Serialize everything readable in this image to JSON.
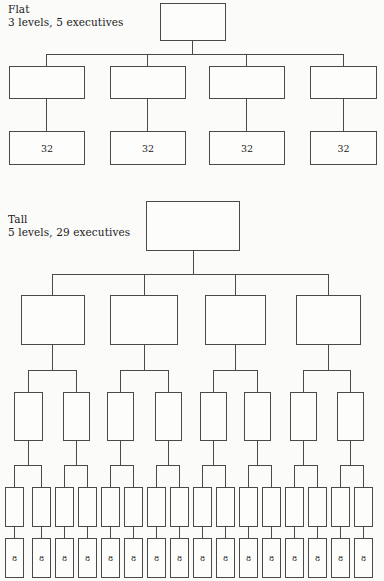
{
  "page": {
    "background_color": "#fbfbf9",
    "line_color": "#4a4a4a",
    "text_color": "#1a1a1a"
  },
  "charts": [
    {
      "id": "flat",
      "caption_title": "Flat",
      "caption_detail": "3 levels, 5 executives",
      "levels": 3,
      "executives": 5,
      "span_of_control": 4,
      "leaf_label": "32",
      "nodes": [
        {
          "name": "flat-level1-node1",
          "label": "",
          "x": 160,
          "y": 3,
          "w": 66,
          "h": 38,
          "level": 1
        },
        {
          "name": "flat-level2-node1",
          "label": "",
          "x": 9,
          "y": 66,
          "w": 76,
          "h": 33,
          "level": 2
        },
        {
          "name": "flat-level2-node2",
          "label": "",
          "x": 110,
          "y": 66,
          "w": 76,
          "h": 33,
          "level": 2
        },
        {
          "name": "flat-level2-node3",
          "label": "",
          "x": 209,
          "y": 66,
          "w": 76,
          "h": 33,
          "level": 2
        },
        {
          "name": "flat-level2-node4",
          "label": "",
          "x": 310,
          "y": 66,
          "w": 67,
          "h": 33,
          "level": 2
        },
        {
          "name": "flat-level3-node1",
          "label": "32",
          "x": 9,
          "y": 131,
          "w": 76,
          "h": 34,
          "level": 3
        },
        {
          "name": "flat-level3-node2",
          "label": "32",
          "x": 110,
          "y": 131,
          "w": 76,
          "h": 34,
          "level": 3
        },
        {
          "name": "flat-level3-node3",
          "label": "32",
          "x": 209,
          "y": 131,
          "w": 76,
          "h": 34,
          "level": 3
        },
        {
          "name": "flat-level3-node4",
          "label": "32",
          "x": 310,
          "y": 131,
          "w": 67,
          "h": 34,
          "level": 3
        }
      ],
      "vlines": [
        {
          "x": 192,
          "y": 41,
          "h": 13
        },
        {
          "x": 46,
          "y": 54,
          "h": 12
        },
        {
          "x": 147,
          "y": 54,
          "h": 12
        },
        {
          "x": 246,
          "y": 54,
          "h": 12
        },
        {
          "x": 343,
          "y": 54,
          "h": 12
        },
        {
          "x": 46,
          "y": 99,
          "h": 32
        },
        {
          "x": 147,
          "y": 99,
          "h": 32
        },
        {
          "x": 246,
          "y": 99,
          "h": 32
        },
        {
          "x": 343,
          "y": 99,
          "h": 32
        }
      ],
      "hlines": [
        {
          "x": 46,
          "y": 54,
          "w": 297
        }
      ]
    },
    {
      "id": "tall",
      "caption_title": "Tall",
      "caption_detail": "5 levels, 29 executives",
      "levels": 5,
      "executives": 29,
      "span_of_control": 2,
      "leaf_label": "8",
      "nodes": [
        {
          "name": "tall-level1-node1",
          "label": "",
          "x": 146,
          "y": 201,
          "w": 94,
          "h": 50,
          "level": 1
        },
        {
          "name": "tall-level2-node1",
          "label": "",
          "x": 21,
          "y": 295,
          "w": 64,
          "h": 50,
          "level": 2
        },
        {
          "name": "tall-level2-node2",
          "label": "",
          "x": 110,
          "y": 295,
          "w": 68,
          "h": 50,
          "level": 2
        },
        {
          "name": "tall-level2-node3",
          "label": "",
          "x": 205,
          "y": 295,
          "w": 61,
          "h": 50,
          "level": 2
        },
        {
          "name": "tall-level2-node4",
          "label": "",
          "x": 296,
          "y": 295,
          "w": 65,
          "h": 50,
          "level": 2
        },
        {
          "name": "tall-level3-node1",
          "label": "",
          "x": 14,
          "y": 392,
          "w": 29,
          "h": 49,
          "level": 3
        },
        {
          "name": "tall-level3-node2",
          "label": "",
          "x": 63,
          "y": 392,
          "w": 27,
          "h": 49,
          "level": 3
        },
        {
          "name": "tall-level3-node3",
          "label": "",
          "x": 107,
          "y": 392,
          "w": 27,
          "h": 49,
          "level": 3
        },
        {
          "name": "tall-level3-node4",
          "label": "",
          "x": 155,
          "y": 392,
          "w": 27,
          "h": 49,
          "level": 3
        },
        {
          "name": "tall-level3-node5",
          "label": "",
          "x": 200,
          "y": 392,
          "w": 27,
          "h": 49,
          "level": 3
        },
        {
          "name": "tall-level3-node6",
          "label": "",
          "x": 244,
          "y": 392,
          "w": 27,
          "h": 49,
          "level": 3
        },
        {
          "name": "tall-level3-node7",
          "label": "",
          "x": 290,
          "y": 392,
          "w": 27,
          "h": 49,
          "level": 3
        },
        {
          "name": "tall-level3-node8",
          "label": "",
          "x": 337,
          "y": 392,
          "w": 27,
          "h": 49,
          "level": 3
        },
        {
          "name": "tall-level4-node1",
          "label": "",
          "x": 5,
          "y": 487,
          "w": 19,
          "h": 40,
          "level": 4
        },
        {
          "name": "tall-level4-node2",
          "label": "",
          "x": 32,
          "y": 487,
          "w": 19,
          "h": 40,
          "level": 4
        },
        {
          "name": "tall-level4-node3",
          "label": "",
          "x": 55,
          "y": 487,
          "w": 19,
          "h": 40,
          "level": 4
        },
        {
          "name": "tall-level4-node4",
          "label": "",
          "x": 78,
          "y": 487,
          "w": 19,
          "h": 40,
          "level": 4
        },
        {
          "name": "tall-level4-node5",
          "label": "",
          "x": 101,
          "y": 487,
          "w": 19,
          "h": 40,
          "level": 4
        },
        {
          "name": "tall-level4-node6",
          "label": "",
          "x": 124,
          "y": 487,
          "w": 19,
          "h": 40,
          "level": 4
        },
        {
          "name": "tall-level4-node7",
          "label": "",
          "x": 147,
          "y": 487,
          "w": 19,
          "h": 40,
          "level": 4
        },
        {
          "name": "tall-level4-node8",
          "label": "",
          "x": 170,
          "y": 487,
          "w": 19,
          "h": 40,
          "level": 4
        },
        {
          "name": "tall-level4-node9",
          "label": "",
          "x": 193,
          "y": 487,
          "w": 19,
          "h": 40,
          "level": 4
        },
        {
          "name": "tall-level4-node10",
          "label": "",
          "x": 216,
          "y": 487,
          "w": 19,
          "h": 40,
          "level": 4
        },
        {
          "name": "tall-level4-node11",
          "label": "",
          "x": 239,
          "y": 487,
          "w": 19,
          "h": 40,
          "level": 4
        },
        {
          "name": "tall-level4-node12",
          "label": "",
          "x": 262,
          "y": 487,
          "w": 19,
          "h": 40,
          "level": 4
        },
        {
          "name": "tall-level4-node13",
          "label": "",
          "x": 285,
          "y": 487,
          "w": 19,
          "h": 40,
          "level": 4
        },
        {
          "name": "tall-level4-node14",
          "label": "",
          "x": 308,
          "y": 487,
          "w": 19,
          "h": 40,
          "level": 4
        },
        {
          "name": "tall-level4-node15",
          "label": "",
          "x": 331,
          "y": 487,
          "w": 19,
          "h": 40,
          "level": 4
        },
        {
          "name": "tall-level4-node16",
          "label": "",
          "x": 354,
          "y": 487,
          "w": 19,
          "h": 40,
          "level": 4
        },
        {
          "name": "tall-level5-node1",
          "label": "8",
          "x": 5,
          "y": 538,
          "w": 19,
          "h": 40,
          "level": 5
        },
        {
          "name": "tall-level5-node2",
          "label": "8",
          "x": 32,
          "y": 538,
          "w": 19,
          "h": 40,
          "level": 5
        },
        {
          "name": "tall-level5-node3",
          "label": "8",
          "x": 55,
          "y": 538,
          "w": 19,
          "h": 40,
          "level": 5
        },
        {
          "name": "tall-level5-node4",
          "label": "8",
          "x": 78,
          "y": 538,
          "w": 19,
          "h": 40,
          "level": 5
        },
        {
          "name": "tall-level5-node5",
          "label": "8",
          "x": 101,
          "y": 538,
          "w": 19,
          "h": 40,
          "level": 5
        },
        {
          "name": "tall-level5-node6",
          "label": "8",
          "x": 124,
          "y": 538,
          "w": 19,
          "h": 40,
          "level": 5
        },
        {
          "name": "tall-level5-node7",
          "label": "8",
          "x": 147,
          "y": 538,
          "w": 19,
          "h": 40,
          "level": 5
        },
        {
          "name": "tall-level5-node8",
          "label": "8",
          "x": 170,
          "y": 538,
          "w": 19,
          "h": 40,
          "level": 5
        },
        {
          "name": "tall-level5-node9",
          "label": "8",
          "x": 193,
          "y": 538,
          "w": 19,
          "h": 40,
          "level": 5
        },
        {
          "name": "tall-level5-node10",
          "label": "8",
          "x": 216,
          "y": 538,
          "w": 19,
          "h": 40,
          "level": 5
        },
        {
          "name": "tall-level5-node11",
          "label": "8",
          "x": 239,
          "y": 538,
          "w": 19,
          "h": 40,
          "level": 5
        },
        {
          "name": "tall-level5-node12",
          "label": "8",
          "x": 262,
          "y": 538,
          "w": 19,
          "h": 40,
          "level": 5
        },
        {
          "name": "tall-level5-node13",
          "label": "8",
          "x": 285,
          "y": 538,
          "w": 19,
          "h": 40,
          "level": 5
        },
        {
          "name": "tall-level5-node14",
          "label": "8",
          "x": 308,
          "y": 538,
          "w": 19,
          "h": 40,
          "level": 5
        },
        {
          "name": "tall-level5-node15",
          "label": "8",
          "x": 331,
          "y": 538,
          "w": 19,
          "h": 40,
          "level": 5
        },
        {
          "name": "tall-level5-node16",
          "label": "8",
          "x": 354,
          "y": 538,
          "w": 19,
          "h": 40,
          "level": 5
        }
      ],
      "vlines": [
        {
          "x": 193,
          "y": 251,
          "h": 23
        },
        {
          "x": 52,
          "y": 274,
          "h": 21
        },
        {
          "x": 144,
          "y": 274,
          "h": 21
        },
        {
          "x": 235,
          "y": 274,
          "h": 21
        },
        {
          "x": 328,
          "y": 274,
          "h": 21
        },
        {
          "x": 52,
          "y": 345,
          "h": 25
        },
        {
          "x": 144,
          "y": 345,
          "h": 25
        },
        {
          "x": 235,
          "y": 345,
          "h": 25
        },
        {
          "x": 328,
          "y": 345,
          "h": 25
        },
        {
          "x": 28,
          "y": 370,
          "h": 22
        },
        {
          "x": 76,
          "y": 370,
          "h": 22
        },
        {
          "x": 120,
          "y": 370,
          "h": 22
        },
        {
          "x": 168,
          "y": 370,
          "h": 22
        },
        {
          "x": 213,
          "y": 370,
          "h": 22
        },
        {
          "x": 257,
          "y": 370,
          "h": 22
        },
        {
          "x": 303,
          "y": 370,
          "h": 22
        },
        {
          "x": 350,
          "y": 370,
          "h": 22
        },
        {
          "x": 28,
          "y": 441,
          "h": 24
        },
        {
          "x": 76,
          "y": 441,
          "h": 24
        },
        {
          "x": 120,
          "y": 441,
          "h": 24
        },
        {
          "x": 168,
          "y": 441,
          "h": 24
        },
        {
          "x": 213,
          "y": 441,
          "h": 24
        },
        {
          "x": 257,
          "y": 441,
          "h": 24
        },
        {
          "x": 303,
          "y": 441,
          "h": 24
        },
        {
          "x": 350,
          "y": 441,
          "h": 24
        },
        {
          "x": 14,
          "y": 465,
          "h": 22
        },
        {
          "x": 41,
          "y": 465,
          "h": 22
        },
        {
          "x": 64,
          "y": 465,
          "h": 22
        },
        {
          "x": 87,
          "y": 465,
          "h": 22
        },
        {
          "x": 110,
          "y": 465,
          "h": 22
        },
        {
          "x": 133,
          "y": 465,
          "h": 22
        },
        {
          "x": 156,
          "y": 465,
          "h": 22
        },
        {
          "x": 179,
          "y": 465,
          "h": 22
        },
        {
          "x": 202,
          "y": 465,
          "h": 22
        },
        {
          "x": 225,
          "y": 465,
          "h": 22
        },
        {
          "x": 248,
          "y": 465,
          "h": 22
        },
        {
          "x": 271,
          "y": 465,
          "h": 22
        },
        {
          "x": 294,
          "y": 465,
          "h": 22
        },
        {
          "x": 317,
          "y": 465,
          "h": 22
        },
        {
          "x": 340,
          "y": 465,
          "h": 22
        },
        {
          "x": 363,
          "y": 465,
          "h": 22
        },
        {
          "x": 14,
          "y": 527,
          "h": 11
        },
        {
          "x": 41,
          "y": 527,
          "h": 11
        },
        {
          "x": 64,
          "y": 527,
          "h": 11
        },
        {
          "x": 87,
          "y": 527,
          "h": 11
        },
        {
          "x": 110,
          "y": 527,
          "h": 11
        },
        {
          "x": 133,
          "y": 527,
          "h": 11
        },
        {
          "x": 156,
          "y": 527,
          "h": 11
        },
        {
          "x": 179,
          "y": 527,
          "h": 11
        },
        {
          "x": 202,
          "y": 527,
          "h": 11
        },
        {
          "x": 225,
          "y": 527,
          "h": 11
        },
        {
          "x": 248,
          "y": 527,
          "h": 11
        },
        {
          "x": 271,
          "y": 527,
          "h": 11
        },
        {
          "x": 294,
          "y": 527,
          "h": 11
        },
        {
          "x": 317,
          "y": 527,
          "h": 11
        },
        {
          "x": 340,
          "y": 527,
          "h": 11
        },
        {
          "x": 363,
          "y": 527,
          "h": 11
        }
      ],
      "hlines": [
        {
          "x": 52,
          "y": 274,
          "w": 276
        },
        {
          "x": 28,
          "y": 370,
          "w": 48
        },
        {
          "x": 120,
          "y": 370,
          "w": 48
        },
        {
          "x": 213,
          "y": 370,
          "w": 44
        },
        {
          "x": 303,
          "y": 370,
          "w": 47
        },
        {
          "x": 14,
          "y": 465,
          "w": 27
        },
        {
          "x": 64,
          "y": 465,
          "w": 23
        },
        {
          "x": 110,
          "y": 465,
          "w": 23
        },
        {
          "x": 156,
          "y": 465,
          "w": 23
        },
        {
          "x": 202,
          "y": 465,
          "w": 23
        },
        {
          "x": 248,
          "y": 465,
          "w": 23
        },
        {
          "x": 294,
          "y": 465,
          "w": 23
        },
        {
          "x": 340,
          "y": 465,
          "w": 23
        }
      ]
    }
  ],
  "captions": [
    {
      "name": "flat-caption",
      "title": "Flat",
      "detail": "3 levels, 5 executives",
      "x": 8,
      "y": 3
    },
    {
      "name": "tall-caption",
      "title": "Tall",
      "detail": "5 levels, 29 executives",
      "x": 8,
      "y": 213
    }
  ]
}
